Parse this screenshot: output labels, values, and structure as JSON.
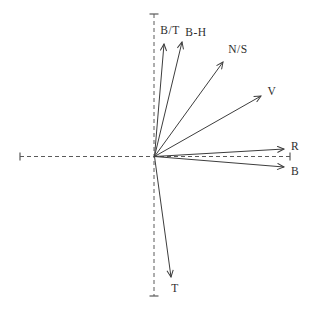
{
  "diagram": {
    "canvas": {
      "width": 313,
      "height": 313,
      "background": "#ffffff"
    },
    "colors": {
      "vector_stroke": "#3d3d3d",
      "axis_stroke": "#5a5a5a",
      "label_text": "#2e2e2e"
    },
    "origin": {
      "x": 154.5,
      "y": 156.5
    },
    "axes": {
      "dash_pattern": "4 3",
      "horizontal": {
        "x1": 20,
        "x2": 290,
        "y": 156.5,
        "tick_half_len": 4
      },
      "vertical": {
        "y1": 14,
        "y2": 296,
        "x": 154,
        "tick_half_len": 4.5
      }
    },
    "vectors": [
      {
        "label": "B/T",
        "tip": {
          "x": 164,
          "y": 44
        },
        "label_pos": {
          "x": 170,
          "y": 31
        }
      },
      {
        "label": "B-H",
        "tip": {
          "x": 182,
          "y": 42
        },
        "label_pos": {
          "x": 196,
          "y": 33
        }
      },
      {
        "label": "N/S",
        "tip": {
          "x": 223,
          "y": 62
        },
        "label_pos": {
          "x": 238,
          "y": 50
        }
      },
      {
        "label": "V",
        "tip": {
          "x": 261,
          "y": 96
        },
        "label_pos": {
          "x": 272,
          "y": 92
        }
      },
      {
        "label": "R",
        "tip": {
          "x": 284,
          "y": 149
        },
        "label_pos": {
          "x": 295,
          "y": 147
        }
      },
      {
        "label": "B",
        "tip": {
          "x": 284,
          "y": 167
        },
        "label_pos": {
          "x": 295,
          "y": 172
        }
      },
      {
        "label": "T",
        "tip": {
          "x": 171,
          "y": 277
        },
        "label_pos": {
          "x": 175,
          "y": 289
        }
      }
    ]
  }
}
